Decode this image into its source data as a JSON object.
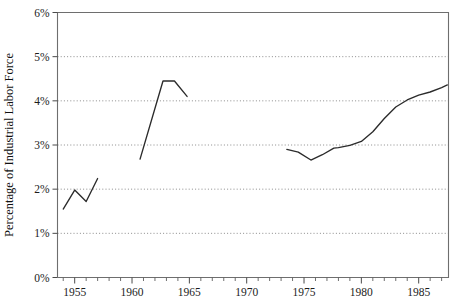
{
  "chart_data": {
    "type": "line",
    "title": "",
    "xlabel": "",
    "ylabel": "Percentage of Industrial Labor Force",
    "xlim": [
      1953.5,
      1987.6
    ],
    "ylim": [
      0,
      6
    ],
    "grid": true,
    "legend": "none",
    "y_tick_labels": [
      "0%",
      "1%",
      "2%",
      "3%",
      "4%",
      "5%",
      "6%"
    ],
    "y_tick_values": [
      0,
      1,
      2,
      3,
      4,
      5,
      6
    ],
    "x_tick_labels": [
      "1955",
      "1960",
      "1965",
      "1970",
      "1975",
      "1980",
      "1985"
    ],
    "x_tick_values": [
      1955,
      1960,
      1965,
      1970,
      1975,
      1980,
      1985
    ],
    "x_minor_tick_interval": 1,
    "series": [
      {
        "name": "segment-1",
        "x": [
          1954.0,
          1955.0,
          1956.0,
          1957.0
        ],
        "values": [
          1.55,
          1.98,
          1.72,
          2.24
        ]
      },
      {
        "name": "segment-2",
        "x": [
          1960.7,
          1962.7,
          1963.7,
          1964.8
        ],
        "values": [
          2.68,
          4.45,
          4.45,
          4.1
        ]
      },
      {
        "name": "segment-3",
        "x": [
          1973.5,
          1974.5,
          1975.6,
          1976.6,
          1977.6,
          1978.0,
          1979.0,
          1980.0,
          1981.0,
          1982.0,
          1983.0,
          1984.0,
          1985.0,
          1986.0,
          1987.0,
          1987.5
        ],
        "values": [
          2.9,
          2.84,
          2.66,
          2.78,
          2.93,
          2.94,
          2.99,
          3.08,
          3.3,
          3.6,
          3.86,
          4.02,
          4.13,
          4.2,
          4.3,
          4.36
        ]
      }
    ]
  }
}
